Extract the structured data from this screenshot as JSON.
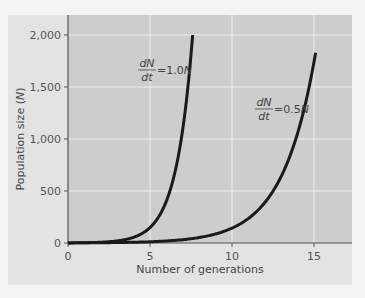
{
  "chart_data": {
    "type": "line",
    "title": "",
    "xlabel": "Number of generations",
    "ylabel": "Population size (N)",
    "xlim": [
      0,
      17.5
    ],
    "ylim": [
      0,
      2200
    ],
    "xticks": [
      0,
      5,
      10,
      15
    ],
    "yticks": [
      0,
      500,
      1000,
      1500,
      2000
    ],
    "ytick_labels": [
      "0",
      "500",
      "1,000",
      "1,500",
      "2,000"
    ],
    "xtick_labels": [
      "0",
      "5",
      "10",
      "15"
    ],
    "grid": true,
    "legend": null,
    "series": [
      {
        "name": "dN/dt = 1.0N",
        "r": 1.0,
        "x": [
          0,
          1,
          2,
          3,
          4,
          5,
          6,
          7,
          7.6
        ],
        "values": [
          1,
          2.7,
          7.4,
          20,
          55,
          148,
          403,
          1097,
          2000
        ]
      },
      {
        "name": "dN/dt = 0.5N",
        "r": 0.5,
        "x": [
          0,
          2,
          4,
          6,
          8,
          10,
          12,
          13,
          14,
          15.1
        ],
        "values": [
          1,
          2.7,
          7.4,
          20,
          55,
          148,
          403,
          665,
          1097,
          1830
        ]
      }
    ],
    "annotations": [
      {
        "text": "dN/dt = 1.0N",
        "numerator": "dN",
        "denominator": "dt",
        "rhs": "=1.0N",
        "near_series": 0
      },
      {
        "text": "dN/dt = 0.5N",
        "numerator": "dN",
        "denominator": "dt",
        "rhs": "=0.5N",
        "near_series": 1
      }
    ]
  },
  "colors": {
    "outer_bg": "#e3e3e3",
    "plot_bg": "#cdcdcd",
    "grid": "#efefef",
    "curve": "#1a1a1a",
    "axis": "#555555"
  }
}
